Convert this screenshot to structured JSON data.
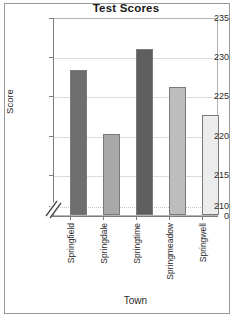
{
  "chart_data": {
    "type": "bar",
    "title": "Test Scores",
    "xlabel": "Town",
    "ylabel": "Score",
    "categories": [
      "Springfield",
      "Springdale",
      "Springtime",
      "Springmeadow",
      "Springwell"
    ],
    "values": [
      228.5,
      220.3,
      231.2,
      226.3,
      222.8
    ],
    "ylim": [
      210,
      235
    ],
    "yticks": [
      235,
      230,
      225,
      220,
      215,
      210
    ],
    "ytick_labels": [
      "235",
      "230",
      "225",
      "220",
      "215",
      "210"
    ],
    "zero_tick_label": "0",
    "axis_break": true,
    "grid": true,
    "legend": "none",
    "bar_colors": [
      "#6e6e6e",
      "#a8a8a8",
      "#5e5e5e",
      "#bdbdbd",
      "#ececec"
    ],
    "bar_border_color": "#7a7a7a",
    "frame_color": "#9a9a9a",
    "grid_color": "#dcdcdc",
    "text_color": "#2b2b2b"
  }
}
